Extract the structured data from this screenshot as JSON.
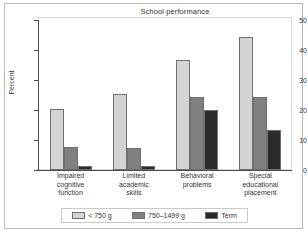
{
  "chart_data": {
    "type": "bar",
    "title": "School performance",
    "xlabel": "",
    "ylabel": "Percent",
    "ylim": [
      0,
      50
    ],
    "yticks": [
      0,
      10,
      20,
      30,
      40,
      50
    ],
    "grid": false,
    "legend_position": "bottom",
    "categories": [
      "Impaired cognitive function",
      "Limited academic skills",
      "Behavioral problems",
      "Special educational placement"
    ],
    "category_lines": [
      [
        "Impaired",
        "cognitive",
        "function"
      ],
      [
        "Limited",
        "academic",
        "skills"
      ],
      [
        "Behavioral",
        "problems"
      ],
      [
        "Special",
        "educational",
        "placement"
      ]
    ],
    "series": [
      {
        "name": "< 750 g",
        "color": "#d4d4d4",
        "values": [
          20.5,
          25.5,
          36.7,
          44.3
        ]
      },
      {
        "name": "750–1499 g",
        "color": "#808080",
        "values": [
          7.7,
          7.5,
          24.4,
          24.4
        ]
      },
      {
        "name": "Term",
        "color": "#2b2b2b",
        "values": [
          1.5,
          1.3,
          20.1,
          13.3
        ]
      }
    ]
  },
  "colors": {
    "series_light": "#d4d4d4",
    "series_medium": "#808080",
    "series_dark": "#2b2b2b",
    "axis": "#4d4d4d",
    "frame": "#b9b9b9",
    "text": "#333333"
  }
}
